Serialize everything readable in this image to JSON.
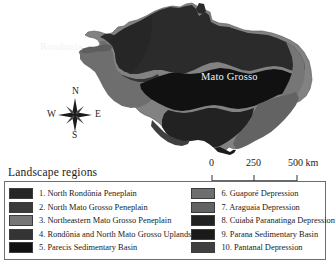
{
  "map": {
    "title_labels": [
      {
        "name": "Rondonia",
        "text": "Rondonia"
      },
      {
        "name": "Mato Grosso",
        "text": "Mato Grosso"
      }
    ],
    "label_rondonia": "Rondonia",
    "label_mato_grosso": "Mato Grosso",
    "background_color": "#ffffff",
    "region_colors": {
      "very_dark": "#1c1c1c",
      "dark": "#2b2b2b",
      "mid_dark": "#3f3f3f",
      "mid": "#565656",
      "mid_light": "#6f6f6f",
      "light": "#828282",
      "lighter": "#949494"
    }
  },
  "compass": {
    "north": "N",
    "east": "E",
    "south": "S",
    "west": "W"
  },
  "scalebar": {
    "ticks": [
      "0",
      "250",
      "500"
    ],
    "tick_0": "0",
    "tick_250": "250",
    "tick_500": "500  km",
    "unit": "km"
  },
  "legend": {
    "title": "Landscape regions",
    "left_items": [
      {
        "number": "1.",
        "label": "1.  North Rondônia Peneplain",
        "color": "#262626"
      },
      {
        "number": "2.",
        "label": "2.  North Mato Grosso Peneplain",
        "color": "#3a3a3a"
      },
      {
        "number": "3.",
        "label": "3.  Northeastern Mato Grosso Peneplain",
        "color": "#767676"
      },
      {
        "number": "4.",
        "label": "4.  Rondônia and North Mato Grosso Uplands",
        "color": "#343434"
      },
      {
        "number": "5.",
        "label": "5.  Parecis Sedimentary Basin",
        "color": "#111111"
      }
    ],
    "right_items": [
      {
        "number": "6.",
        "label": "6.  Guaporé Depression",
        "color": "#6e6e6e"
      },
      {
        "number": "7.",
        "label": "7.  Araguaia Depression",
        "color": "#636363"
      },
      {
        "number": "8.",
        "label": "8.  Cuiabá Paranatinga Depression",
        "color": "#222222"
      },
      {
        "number": "9.",
        "label": "9.  Parana Sedimentary Basin",
        "color": "#1a1a1a"
      },
      {
        "number": "10.",
        "label": "10. Pantanal Depression",
        "color": "#3f3f3f"
      }
    ]
  }
}
